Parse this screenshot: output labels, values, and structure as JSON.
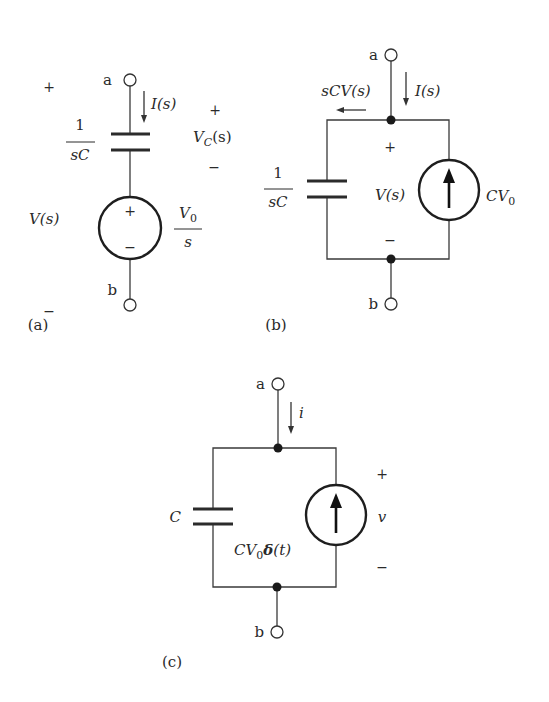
{
  "figure": {
    "panels": [
      {
        "id": "a",
        "caption": "(a)",
        "terminal_top": "a",
        "terminal_bottom": "b",
        "current_label": "I(s)",
        "capacitor_impedance": {
          "numerator": "1",
          "denominator": "sC"
        },
        "capacitor_voltage": {
          "symbol": "V",
          "subscript": "C",
          "argument": "(s)",
          "plus": "+",
          "minus": "−"
        },
        "port_voltage": {
          "label": "V(s)",
          "plus": "+",
          "minus": "−"
        },
        "source": {
          "type": "voltage",
          "value": {
            "numerator_symbol": "V",
            "numerator_subscript": "0",
            "denominator": "s"
          },
          "plus": "+",
          "minus": "−"
        }
      },
      {
        "id": "b",
        "caption": "(b)",
        "terminal_top": "a",
        "terminal_bottom": "b",
        "current_label": "I(s)",
        "branch_current_label": "sCV(s)",
        "capacitor_impedance": {
          "numerator": "1",
          "denominator": "sC"
        },
        "node_voltage": {
          "label": "V(s)",
          "plus": "+",
          "minus": "−"
        },
        "source": {
          "type": "current",
          "value": {
            "symbol": "CV",
            "subscript": "0"
          }
        }
      },
      {
        "id": "c",
        "caption": "(c)",
        "terminal_top": "a",
        "terminal_bottom": "b",
        "current_label": "i",
        "capacitor_label": "C",
        "voltage": {
          "label": "v",
          "plus": "+",
          "minus": "−"
        },
        "source": {
          "type": "current",
          "value": {
            "prefix": "CV",
            "subscript": "0",
            "delta": "δ",
            "argument": "(t)"
          }
        }
      }
    ]
  }
}
